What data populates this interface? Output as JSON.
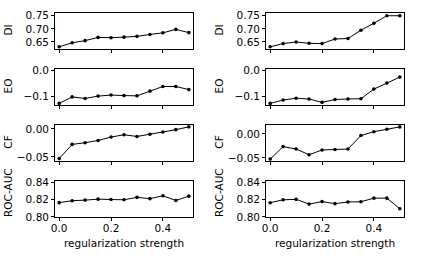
{
  "figure": {
    "xlabel": "regularization strength",
    "x_ticks": [
      "0.0",
      "0.2",
      "0.4"
    ],
    "x_tick_values": [
      0.0,
      0.2,
      0.4
    ],
    "xlim": [
      -0.02,
      0.52
    ],
    "n_rows": 4,
    "n_cols": 2,
    "line_color": "#000000",
    "marker_color": "#000000",
    "background_color": "#ffffff"
  },
  "chart_data": [
    {
      "type": "line",
      "panel": "left-DI",
      "title": "",
      "xlabel": "regularization strength",
      "ylabel": "DI",
      "x": [
        0.0,
        0.05,
        0.1,
        0.15,
        0.2,
        0.25,
        0.3,
        0.35,
        0.4,
        0.45,
        0.5
      ],
      "values": [
        0.632,
        0.647,
        0.655,
        0.667,
        0.666,
        0.668,
        0.671,
        0.678,
        0.684,
        0.697,
        0.685
      ],
      "ylim": [
        0.62,
        0.762
      ],
      "y_ticks": [
        0.65,
        0.7,
        0.75
      ],
      "y_tick_labels": [
        "0.65",
        "0.70",
        "0.75"
      ],
      "grid": false,
      "legend": false
    },
    {
      "type": "line",
      "panel": "left-EO",
      "title": "",
      "xlabel": "regularization strength",
      "ylabel": "EO",
      "x": [
        0.0,
        0.05,
        0.1,
        0.15,
        0.2,
        0.25,
        0.3,
        0.35,
        0.4,
        0.45,
        0.5
      ],
      "values": [
        -0.128,
        -0.103,
        -0.109,
        -0.1,
        -0.096,
        -0.098,
        -0.099,
        -0.081,
        -0.063,
        -0.063,
        -0.075
      ],
      "ylim": [
        -0.138,
        0.008
      ],
      "y_ticks": [
        -0.1,
        0.0
      ],
      "y_tick_labels": [
        "-0.1",
        "0.0"
      ],
      "grid": false,
      "legend": false
    },
    {
      "type": "line",
      "panel": "left-CF",
      "title": "",
      "xlabel": "regularization strength",
      "ylabel": "CF",
      "x": [
        0.0,
        0.05,
        0.1,
        0.15,
        0.2,
        0.25,
        0.3,
        0.35,
        0.4,
        0.45,
        0.5
      ],
      "values": [
        -0.053,
        -0.028,
        -0.025,
        -0.021,
        -0.015,
        -0.011,
        -0.014,
        -0.01,
        -0.006,
        -0.002,
        0.003
      ],
      "ylim": [
        -0.059,
        0.008
      ],
      "y_ticks": [
        -0.05,
        0.0
      ],
      "y_tick_labels": [
        "-0.05",
        "0.00"
      ],
      "grid": false,
      "legend": false
    },
    {
      "type": "line",
      "panel": "left-ROC-AUC",
      "title": "",
      "xlabel": "regularization strength",
      "ylabel": "ROC-AUC",
      "x": [
        0.0,
        0.05,
        0.1,
        0.15,
        0.2,
        0.25,
        0.3,
        0.35,
        0.4,
        0.45,
        0.5
      ],
      "values": [
        0.8163,
        0.8185,
        0.8192,
        0.8203,
        0.8199,
        0.8196,
        0.8224,
        0.8209,
        0.8242,
        0.8188,
        0.8238
      ],
      "ylim": [
        0.7985,
        0.8425
      ],
      "y_ticks": [
        0.8,
        0.82,
        0.84
      ],
      "y_tick_labels": [
        "0.80",
        "0.82",
        "0.84"
      ],
      "grid": false,
      "legend": false
    },
    {
      "type": "line",
      "panel": "right-DI",
      "title": "",
      "xlabel": "regularization strength",
      "ylabel": "DI",
      "x": [
        0.0,
        0.05,
        0.1,
        0.15,
        0.2,
        0.25,
        0.3,
        0.35,
        0.4,
        0.45,
        0.5
      ],
      "values": [
        0.632,
        0.644,
        0.65,
        0.645,
        0.644,
        0.661,
        0.663,
        0.694,
        0.72,
        0.748,
        0.748
      ],
      "ylim": [
        0.62,
        0.762
      ],
      "y_ticks": [
        0.65,
        0.7,
        0.75
      ],
      "y_tick_labels": [
        "0.65",
        "0.70",
        "0.75"
      ],
      "grid": false,
      "legend": false
    },
    {
      "type": "line",
      "panel": "right-EO",
      "title": "",
      "xlabel": "regularization strength",
      "ylabel": "EO",
      "x": [
        0.0,
        0.05,
        0.1,
        0.15,
        0.2,
        0.25,
        0.3,
        0.35,
        0.4,
        0.45,
        0.5
      ],
      "values": [
        -0.128,
        -0.115,
        -0.108,
        -0.111,
        -0.124,
        -0.113,
        -0.111,
        -0.11,
        -0.073,
        -0.05,
        -0.027
      ],
      "ylim": [
        -0.138,
        0.008
      ],
      "y_ticks": [
        -0.1,
        0.0
      ],
      "y_tick_labels": [
        "-0.1",
        "0.0"
      ],
      "grid": false,
      "legend": false
    },
    {
      "type": "line",
      "panel": "right-CF",
      "title": "",
      "xlabel": "regularization strength",
      "ylabel": "CF",
      "x": [
        0.0,
        0.05,
        0.1,
        0.15,
        0.2,
        0.25,
        0.3,
        0.35,
        0.4,
        0.45,
        0.5
      ],
      "values": [
        -0.053,
        -0.027,
        -0.032,
        -0.044,
        -0.034,
        -0.033,
        -0.032,
        -0.004,
        0.004,
        0.009,
        0.014
      ],
      "ylim": [
        -0.059,
        0.02
      ],
      "y_ticks": [
        -0.05,
        0.0
      ],
      "y_tick_labels": [
        "-0.05",
        "0.00"
      ],
      "grid": false,
      "legend": false
    },
    {
      "type": "line",
      "panel": "right-ROC-AUC",
      "title": "",
      "xlabel": "regularization strength",
      "ylabel": "ROC-AUC",
      "x": [
        0.0,
        0.05,
        0.1,
        0.15,
        0.2,
        0.25,
        0.3,
        0.35,
        0.4,
        0.45,
        0.5
      ],
      "values": [
        0.8162,
        0.8196,
        0.8201,
        0.8146,
        0.8175,
        0.8151,
        0.8171,
        0.8173,
        0.8215,
        0.8215,
        0.8092
      ],
      "ylim": [
        0.7985,
        0.8425
      ],
      "y_ticks": [
        0.8,
        0.82,
        0.84
      ],
      "y_tick_labels": [
        "0.80",
        "0.82",
        "0.84"
      ],
      "grid": false,
      "legend": false
    }
  ]
}
